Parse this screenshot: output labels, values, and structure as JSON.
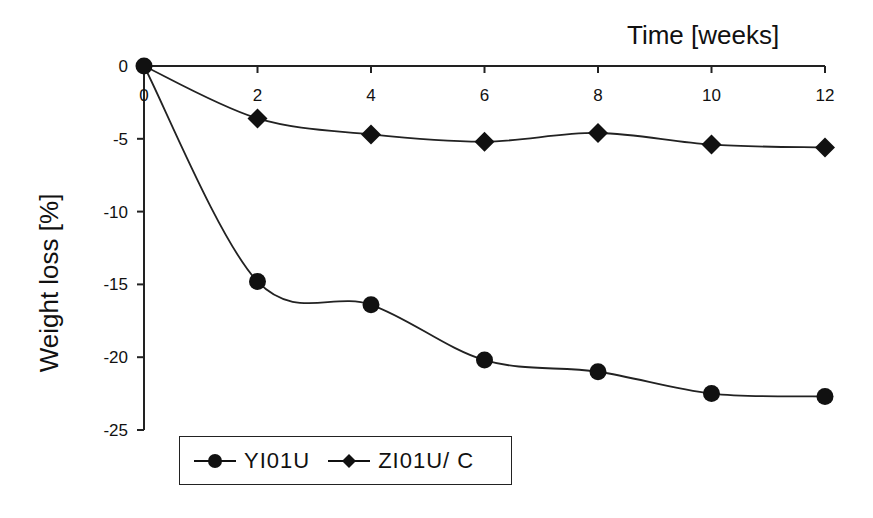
{
  "chart_data": {
    "type": "line",
    "title": "",
    "xlabel": "Time  [weeks]",
    "ylabel": "Weight  loss [%]",
    "x": [
      0,
      2,
      4,
      6,
      8,
      10,
      12
    ],
    "x_ticks": [
      "0",
      "2",
      "4",
      "6",
      "8",
      "10",
      "12"
    ],
    "y_ticks": [
      "0",
      "-5",
      "-10",
      "-15",
      "-20",
      "-25"
    ],
    "xlim": [
      0,
      12
    ],
    "ylim": [
      -25,
      0
    ],
    "grid": false,
    "legend_position": "bottom-left",
    "series": [
      {
        "name": "YI01U",
        "marker": "circle",
        "values": [
          0,
          -14.8,
          -16.4,
          -20.2,
          -21.0,
          -22.5,
          -22.7
        ]
      },
      {
        "name": "ZI01U/C",
        "marker": "diamond",
        "values": [
          0,
          -3.6,
          -4.7,
          -5.2,
          -4.6,
          -5.4,
          -5.6
        ]
      }
    ]
  },
  "legend": {
    "items": [
      {
        "label": "YI01U",
        "marker": "circle"
      },
      {
        "label": "ZI01U/ C",
        "marker": "diamond"
      }
    ]
  }
}
